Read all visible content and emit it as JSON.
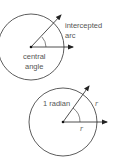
{
  "diagram_top": {
    "title": "central angle and intercepted arc",
    "labels": {
      "intercepted_line1": "intercepted",
      "intercepted_line2": "arc",
      "central_line1": "central",
      "central_line2": "angle"
    }
  },
  "diagram_bottom": {
    "title": "one radian",
    "labels": {
      "radian": "1 radian",
      "arc_r": "r",
      "radius_r": "r"
    }
  },
  "colors": {
    "stroke": "#333333",
    "text": "#555555",
    "background": "#ffffff"
  }
}
